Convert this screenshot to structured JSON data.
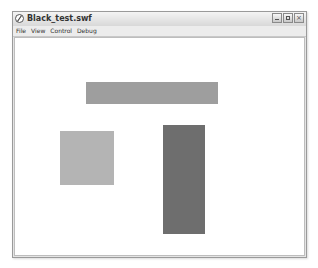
{
  "window": {
    "title": "Black_test.swf",
    "controls": [
      "minimize",
      "maximize",
      "close"
    ],
    "close_glyph": "×"
  },
  "menubar": {
    "items": [
      "File",
      "View",
      "Control",
      "Debug"
    ]
  },
  "stage": {
    "shapes": [
      {
        "name": "horizontal-bar",
        "x": 86,
        "y": 82,
        "w": 132,
        "h": 22,
        "color": "#9e9e9e"
      },
      {
        "name": "square",
        "x": 60,
        "y": 131,
        "w": 54,
        "h": 54,
        "color": "#b4b4b4"
      },
      {
        "name": "vertical-bar",
        "x": 163,
        "y": 125,
        "w": 42,
        "h": 109,
        "color": "#6e6e6e"
      }
    ]
  }
}
